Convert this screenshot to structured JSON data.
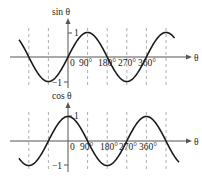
{
  "chart_data": [
    {
      "type": "line",
      "title": "",
      "ylabel": "sin θ",
      "xlabel": "θ",
      "function": "sin",
      "x_ticks": [
        "0",
        "90°",
        "180°",
        "270°",
        "360°"
      ],
      "y_ticks": [
        "1",
        "−1"
      ],
      "x_range_deg": [
        -225,
        490
      ],
      "ylim": [
        -1,
        1
      ],
      "grid": "vertical dashed at every 90°",
      "x": [
        -180,
        -90,
        0,
        90,
        180,
        270,
        360,
        450
      ],
      "values": [
        0,
        1,
        0,
        -1,
        0,
        1,
        0,
        -1
      ]
    },
    {
      "type": "line",
      "title": "",
      "ylabel": "cos θ",
      "xlabel": "θ",
      "function": "cos",
      "x_ticks": [
        "0",
        "90°",
        "180°",
        "270°",
        "360°"
      ],
      "y_ticks": [
        "1",
        "−1"
      ],
      "x_range_deg": [
        -225,
        510
      ],
      "ylim": [
        -1,
        1
      ],
      "grid": "vertical dashed at every 90°",
      "x": [
        -180,
        -90,
        0,
        90,
        180,
        270,
        360,
        450
      ],
      "values": [
        -1,
        0,
        1,
        0,
        -1,
        0,
        1,
        0
      ]
    }
  ],
  "labels": {
    "sin_ylabel": "sin θ",
    "cos_ylabel": "cos θ",
    "theta": "θ",
    "one": "1",
    "minus_one": "−1",
    "zero": "0",
    "t90": "90°",
    "t180": "180°",
    "t270": "270°",
    "t360": "360°"
  }
}
